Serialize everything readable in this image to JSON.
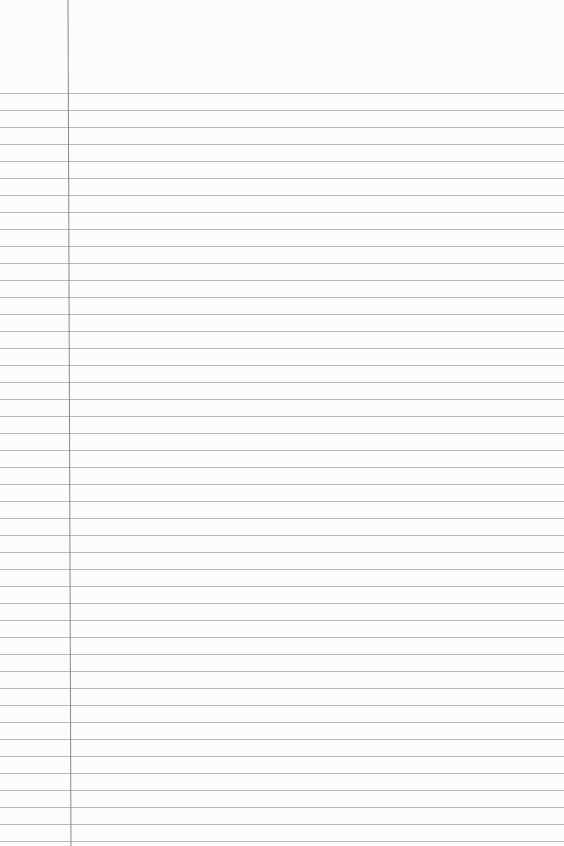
{
  "page": {
    "type": "ruled-notebook-paper",
    "background_color": "#fcfcfc",
    "rule_color": "#b9b9b9",
    "margin_line_color": "#8a8a8a",
    "first_rule_y": 93,
    "rule_spacing": 17,
    "rule_count": 45,
    "margin_x": 69,
    "text": []
  }
}
